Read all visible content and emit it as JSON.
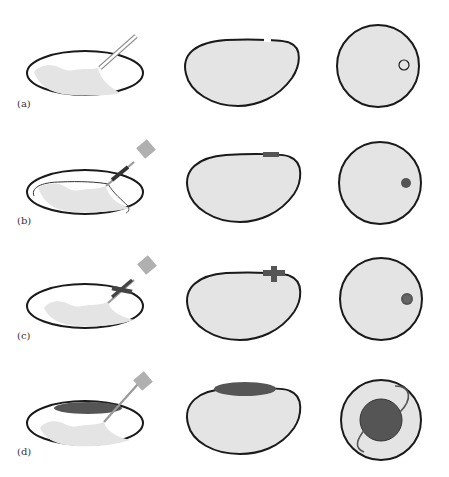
{
  "figure": {
    "rows": [
      {
        "label": "(a)",
        "stage": "needle-insertion"
      },
      {
        "label": "(b)",
        "stage": "catheter-placement"
      },
      {
        "label": "(c)",
        "stage": "balloon-anchor"
      },
      {
        "label": "(d)",
        "stage": "inflated-expansion"
      }
    ],
    "columns": [
      "side-view-dish",
      "cross-section-oval",
      "cross-section-circle"
    ]
  },
  "colors": {
    "outline": "#1a1a1a",
    "fill": "#e4e4e4",
    "dark_fill": "#555555",
    "tool": "#b5b5b5",
    "background": "#ffffff"
  }
}
